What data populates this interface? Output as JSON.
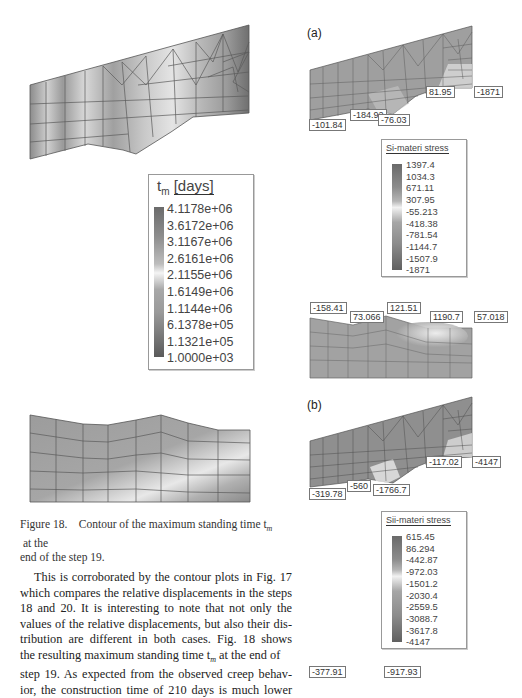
{
  "left_figure": {
    "legend": {
      "title_var": "t",
      "title_sub": "m",
      "title_unit": "[days]",
      "values": [
        "4.1178e+06",
        "3.6172e+06",
        "3.1167e+06",
        "2.6161e+06",
        "2.1155e+06",
        "1.6149e+06",
        "1.1144e+06",
        "6.1378e+05",
        "1.1321e+05",
        "1.0000e+03"
      ]
    },
    "caption_line1": "Figure 18.    Contour of the maximum standing time t",
    "caption_sub": "m",
    "caption_line1_tail": " at the",
    "caption_line2": "end of the step 19."
  },
  "body_text": {
    "lines": [
      "This is corroborated by the contour plots in Fig. 17",
      "which compares the relative displacements in the steps",
      "18 and 20. It is interesting to note that not only the",
      "values of the relative displacements, but also their dis-",
      "tribution are different in both cases. Fig. 18 shows",
      "the resulting maximum standing time t",
      "step 19. As expected from the observed creep behav-",
      "ior, the construction time of 210 days is much lower"
    ],
    "line6_sub": "m",
    "line6_tail": " at the end of"
  },
  "panel_a": {
    "tag": "(a)",
    "labels": [
      "-101.84",
      "-184.92",
      "-76.03",
      "81.95",
      "-1871"
    ],
    "legend": {
      "title": "Si-materi stress",
      "values": [
        "1397.4",
        "1034.3",
        "671.11",
        "307.95",
        "-55.213",
        "-418.38",
        "-781.54",
        "-1144.7",
        "-1507.9",
        "-1871"
      ]
    },
    "lower_labels": [
      "-158.41",
      "73.066",
      "121.51",
      "1190.7",
      "57.018"
    ]
  },
  "panel_b": {
    "tag": "(b)",
    "labels": [
      "-319.78",
      "-560",
      "-1766.7",
      "-117.02",
      "-4147"
    ],
    "legend": {
      "title": "Sii-materi stress",
      "values": [
        "615.45",
        "86.294",
        "-442.87",
        "-972.03",
        "-1501.2",
        "-2030.4",
        "-2559.5",
        "-3088.7",
        "-3617.8",
        "-4147"
      ]
    },
    "lower_labels": [
      "-377.91",
      "-917.93"
    ]
  }
}
